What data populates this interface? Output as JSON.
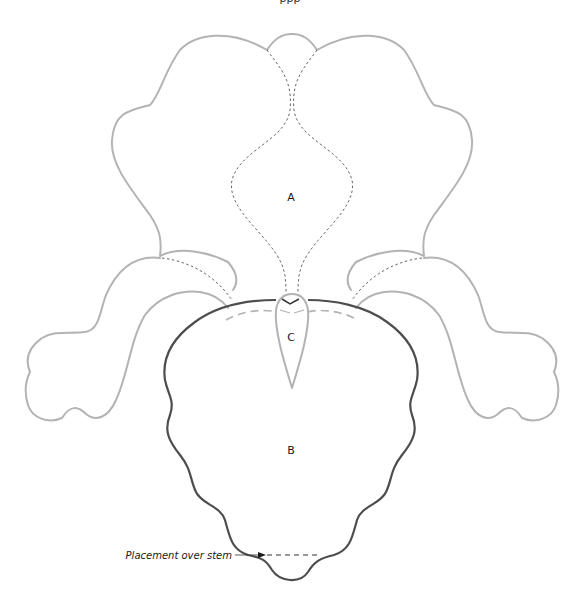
{
  "diagram": {
    "title_partial": "ppp",
    "labels": {
      "a": "A",
      "b": "B",
      "c": "C"
    },
    "annotation": {
      "text": "Placement over stem"
    },
    "colors": {
      "light_outline": "#b3b3b3",
      "dark_outline": "#4d4d4d",
      "dotted_fold": "#555555",
      "text": "#1a1a1a",
      "background": "#ffffff"
    },
    "parts": [
      {
        "id": "A",
        "description": "upper standard petals (two lobes with dotted fold lines)"
      },
      {
        "id": "B",
        "description": "lower fall petal (dark ruffled outline)"
      },
      {
        "id": "C",
        "description": "central beard / style piece"
      }
    ]
  }
}
